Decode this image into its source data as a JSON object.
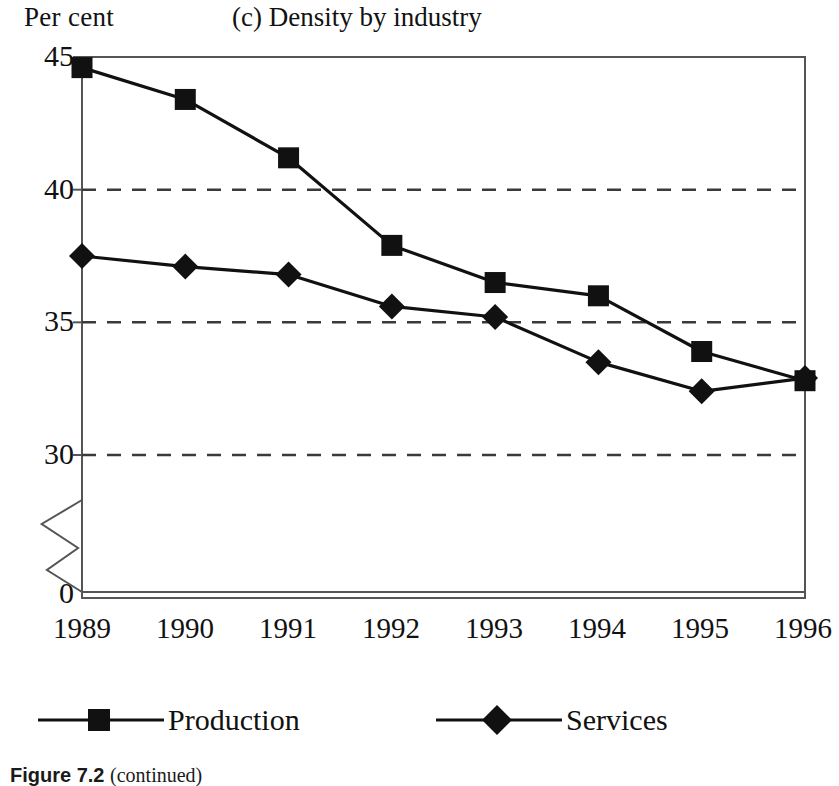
{
  "figure": {
    "caption_label": "Figure 7.2",
    "caption_note": "(continued)"
  },
  "chart_data": {
    "type": "line",
    "title": "(c) Density by industry",
    "xlabel": "",
    "ylabel": "Per cent",
    "categories": [
      "1989",
      "1990",
      "1991",
      "1992",
      "1993",
      "1994",
      "1995",
      "1996"
    ],
    "x": [
      1989,
      1990,
      1991,
      1992,
      1993,
      1994,
      1995,
      1996
    ],
    "series": [
      {
        "name": "Production",
        "marker": "square",
        "color": "#111111",
        "values": [
          44.6,
          43.4,
          41.2,
          37.9,
          36.5,
          36.0,
          33.9,
          32.8
        ]
      },
      {
        "name": "Services",
        "marker": "diamond",
        "color": "#111111",
        "values": [
          37.5,
          37.1,
          36.8,
          35.6,
          35.2,
          33.5,
          32.4,
          32.9
        ]
      }
    ],
    "ylim": [
      29,
      45
    ],
    "yticks": [
      45,
      40,
      35,
      30
    ],
    "ytick_labels": [
      "45",
      "40",
      "35",
      "30"
    ],
    "y_zero_label": "0",
    "y_axis_break": true,
    "grid": true,
    "gridlines_at": [
      40,
      35,
      30
    ],
    "grid_style": "dashed",
    "legend_position": "bottom"
  },
  "legend": {
    "items": [
      {
        "label": "Production",
        "marker": "square-marker"
      },
      {
        "label": "Services",
        "marker": "diamond-marker"
      }
    ]
  }
}
